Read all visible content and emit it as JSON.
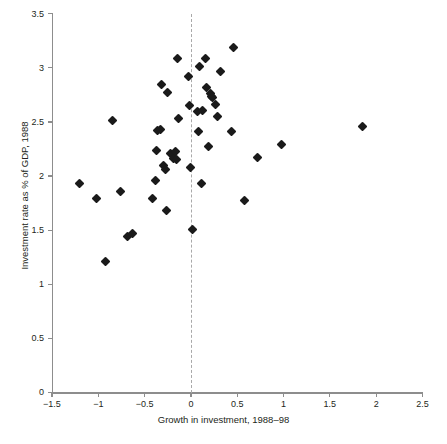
{
  "chart_data": {
    "type": "scatter",
    "title": "",
    "xlabel": "Growth in investment, 1988–98",
    "ylabel": "Investment rate as % of GDP, 1988",
    "xlim": [
      -1.5,
      2.5
    ],
    "ylim": [
      0,
      3.5
    ],
    "xticks": [
      -1.5,
      -1,
      -0.5,
      0,
      0.5,
      1,
      1.5,
      2,
      2.5
    ],
    "xticklabels": [
      "−1.5",
      "−1",
      "−0.5",
      "0",
      "0.5",
      "1",
      "1.5",
      "2",
      "2.5"
    ],
    "yticks": [
      0,
      0.5,
      1,
      1.5,
      2,
      2.5,
      3,
      3.5
    ],
    "yticklabels": [
      "0",
      "0.5",
      "1",
      "1.5",
      "2",
      "2.5",
      "3",
      "3.5"
    ],
    "grid": false,
    "legend": null,
    "marker": "diamond",
    "marker_color": "#1a1a1a",
    "annotations": [
      {
        "name": "zero-reference-line",
        "type": "vline",
        "x": 0,
        "style": "dashed",
        "color": "#a9a9a9"
      }
    ],
    "series": [
      {
        "name": "Countries",
        "points": [
          [
            -1.2,
            1.93
          ],
          [
            -1.02,
            1.79
          ],
          [
            -0.92,
            1.21
          ],
          [
            -0.85,
            2.51
          ],
          [
            -0.76,
            1.86
          ],
          [
            -0.68,
            1.44
          ],
          [
            -0.63,
            1.47
          ],
          [
            -0.41,
            1.79
          ],
          [
            -0.38,
            1.96
          ],
          [
            -0.37,
            2.24
          ],
          [
            -0.36,
            2.42
          ],
          [
            -0.33,
            2.43
          ],
          [
            -0.32,
            2.85
          ],
          [
            -0.3,
            2.1
          ],
          [
            -0.27,
            2.06
          ],
          [
            -0.26,
            1.68
          ],
          [
            -0.25,
            2.77
          ],
          [
            -0.22,
            2.21
          ],
          [
            -0.19,
            2.16
          ],
          [
            -0.17,
            2.23
          ],
          [
            -0.16,
            2.15
          ],
          [
            -0.14,
            3.09
          ],
          [
            -0.13,
            2.53
          ],
          [
            -0.03,
            2.92
          ],
          [
            -0.02,
            2.65
          ],
          [
            -0.01,
            2.08
          ],
          [
            0.02,
            1.51
          ],
          [
            0.07,
            2.6
          ],
          [
            0.08,
            2.41
          ],
          [
            0.09,
            3.01
          ],
          [
            0.11,
            1.93
          ],
          [
            0.13,
            2.61
          ],
          [
            0.16,
            3.09
          ],
          [
            0.17,
            2.82
          ],
          [
            0.19,
            2.27
          ],
          [
            0.21,
            2.76
          ],
          [
            0.22,
            2.74
          ],
          [
            0.23,
            2.73
          ],
          [
            0.26,
            2.66
          ],
          [
            0.29,
            2.55
          ],
          [
            0.32,
            2.97
          ],
          [
            0.44,
            2.41
          ],
          [
            0.46,
            3.19
          ],
          [
            0.58,
            1.77
          ],
          [
            0.72,
            2.17
          ],
          [
            0.98,
            2.29
          ],
          [
            1.85,
            2.46
          ]
        ]
      }
    ]
  },
  "caption": ""
}
